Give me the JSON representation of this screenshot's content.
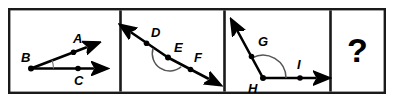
{
  "figure": {
    "background_color": "#ffffff",
    "ink_color": "#000000",
    "border_color": "#1a1a1a",
    "arc_color": "#555555",
    "panel_count": 4
  },
  "panels": [
    {
      "id": "panel-1",
      "kind": "angle-diagram",
      "angle_name": "angle ABC",
      "angle_type": "acute",
      "vertex": "B",
      "arc_style": "single-thin-arc",
      "points": [
        {
          "label": "A",
          "role": "ray-endpoint-upper",
          "dot": true
        },
        {
          "label": "B",
          "role": "vertex",
          "dot": true
        },
        {
          "label": "C",
          "role": "ray-endpoint-lower",
          "dot": true
        }
      ],
      "rays": [
        {
          "from": "B",
          "through": "A",
          "arrowhead": true
        },
        {
          "from": "B",
          "through": "C",
          "arrowhead": true
        }
      ]
    },
    {
      "id": "panel-2",
      "kind": "angle-diagram",
      "angle_name": "angle DEF",
      "angle_type": "straight",
      "vertex": "E",
      "arc_style": "semicircle-arc",
      "points": [
        {
          "label": "D",
          "role": "line-point-upper-left",
          "dot": true
        },
        {
          "label": "E",
          "role": "vertex",
          "dot": true
        },
        {
          "label": "F",
          "role": "line-point-lower-right",
          "dot": true
        }
      ],
      "rays": [
        {
          "from": "E",
          "through": "D",
          "arrowhead": true
        },
        {
          "from": "E",
          "through": "F",
          "arrowhead": true
        }
      ]
    },
    {
      "id": "panel-3",
      "kind": "angle-diagram",
      "angle_name": "angle GHI",
      "angle_type": "obtuse",
      "vertex": "H",
      "arc_style": "wide-arc",
      "points": [
        {
          "label": "G",
          "role": "ray-endpoint-upper",
          "dot": true
        },
        {
          "label": "H",
          "role": "vertex",
          "dot": true
        },
        {
          "label": "I",
          "role": "ray-endpoint-right",
          "dot": true
        }
      ],
      "rays": [
        {
          "from": "H",
          "through": "G",
          "arrowhead": true
        },
        {
          "from": "H",
          "through": "I",
          "arrowhead": true
        }
      ]
    },
    {
      "id": "panel-4",
      "kind": "unknown-placeholder",
      "content": "?"
    }
  ],
  "labels": {
    "a": "A",
    "b": "B",
    "c": "C",
    "d": "D",
    "e": "E",
    "f": "F",
    "g": "G",
    "h": "H",
    "i": "I",
    "question_mark": "?"
  }
}
